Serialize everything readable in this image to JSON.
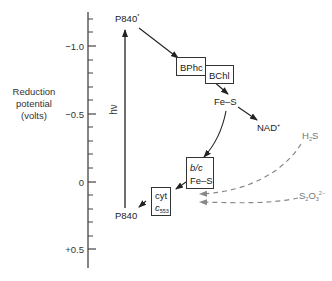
{
  "axis": {
    "title_line1": "Reduction",
    "title_line2": "potential",
    "title_line3": "(volts)",
    "tick_labels": [
      "−1.0",
      "−0.5",
      "0",
      "+0.5"
    ],
    "range_volts": [
      -1.25,
      0.63
    ],
    "minor_tick_step": 0.1
  },
  "photon_label": "hν",
  "nodes": {
    "p840_excited": {
      "label": "P840",
      "superscript": "*"
    },
    "bphc": {
      "label": "BPhc"
    },
    "bchl": {
      "label": "BChl"
    },
    "fes_top": {
      "label": "Fe–S"
    },
    "nad": {
      "label": "NAD",
      "superscript": "+"
    },
    "bc_complex": {
      "line1": "b/c",
      "line2": "Fe–S"
    },
    "cyt_c553": {
      "line1": "cyt",
      "line2": "c",
      "subscript": "553"
    },
    "p840": {
      "label": "P840"
    }
  },
  "donors": {
    "h2s": {
      "label": "H",
      "subscript": "2",
      "tail": "S"
    },
    "thiosulfate": {
      "label": "S",
      "subscript1": "2",
      "mid": "O",
      "subscript2": "3",
      "superscript": "2−"
    }
  },
  "colors": {
    "line": "#222222",
    "dashed": "#777777",
    "text": "#222222"
  }
}
